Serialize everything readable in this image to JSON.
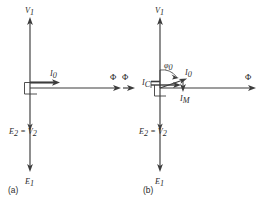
{
  "figure": {
    "kind": "transformer-no-load-phasor-diagrams",
    "panels": [
      {
        "id": "a",
        "caption": "(a)",
        "description": "Ideal transformer no-load phasor diagram: exciting current I0 in phase with flux Phi",
        "labels": {
          "v1": "V",
          "v1_sub": "1",
          "e1": "E",
          "e1_sub": "1",
          "e2v2_e": "E",
          "e2v2_e_sub": "2",
          "e2v2_eq": " = ",
          "e2v2_v": "V",
          "e2v2_v_sub": "2",
          "i0": "I",
          "i0_sub": "0",
          "flux": "Φ"
        }
      },
      {
        "id": "b",
        "caption": "(b)",
        "description": "Practical transformer no-load phasor diagram: exciting current I0 at angle phi0, resolved into core-loss component IC and magnetizing component IM",
        "labels": {
          "v1": "V",
          "v1_sub": "1",
          "e1": "E",
          "e1_sub": "1",
          "e2v2_e": "E",
          "e2v2_e_sub": "2",
          "e2v2_eq": " = ",
          "e2v2_v": "V",
          "e2v2_v_sub": "2",
          "i0": "I",
          "i0_sub": "0",
          "ic": "I",
          "ic_sub": "C",
          "im": "I",
          "im_sub": "M",
          "angle": "φ",
          "angle_sub": "0",
          "flux_left": "Φ",
          "flux_right": "Φ"
        }
      }
    ],
    "colors": {
      "stroke": "#3c3c3c",
      "text": "#2b2b2b",
      "background": "#ffffff"
    }
  }
}
